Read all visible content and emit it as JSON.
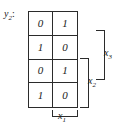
{
  "figure": {
    "type": "karnaugh-map",
    "output_label": "y",
    "output_subscript": "2",
    "output_colon": ":"
  },
  "grid": {
    "rows": 4,
    "columns": 2,
    "cells": [
      [
        "0",
        "1"
      ],
      [
        "1",
        "0"
      ],
      [
        "0",
        "1"
      ],
      [
        "1",
        "0"
      ]
    ]
  },
  "variables": [
    {
      "name": "x",
      "subscript": "3",
      "orientation": "vertical-right",
      "spans_rows": [
        1,
        3
      ]
    },
    {
      "name": "x",
      "subscript": "2",
      "orientation": "vertical-right",
      "spans_rows": [
        3,
        4
      ]
    },
    {
      "name": "x",
      "subscript": "1",
      "orientation": "horizontal-bottom",
      "spans_columns": [
        2,
        2
      ]
    }
  ],
  "colors": {
    "ink": "#1a1a1a",
    "rule": "#2b2b2b",
    "background": "#ffffff"
  }
}
